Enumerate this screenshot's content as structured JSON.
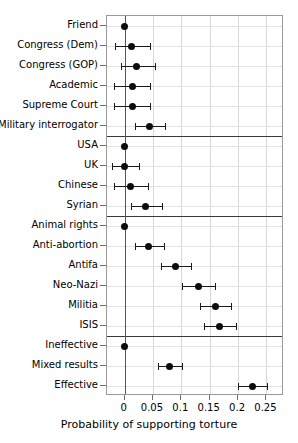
{
  "chart_data": {
    "type": "scatter",
    "title": "",
    "xlabel": "Probability of supporting torture",
    "ylabel": "",
    "xlim": [
      -0.031,
      0.281
    ],
    "ylim_categories_top_to_bottom": true,
    "grid": true,
    "legend": "none",
    "xticks": [
      0,
      0.05,
      0.1,
      0.15,
      0.2,
      0.25
    ],
    "xticklabels": [
      "0",
      "0.05",
      "0.1",
      "0.15",
      "0.2",
      "0.25"
    ],
    "reference_line_x": 0,
    "group_separators_after": [
      "Military interrogator",
      "Syrian",
      "ISIS"
    ],
    "categories": [
      "Friend",
      "Congress (Dem)",
      "Congress (GOP)",
      "Academic",
      "Supreme Court",
      "Military interrogator",
      "USA",
      "UK",
      "Chinese",
      "Syrian",
      "Animal rights",
      "Anti-abortion",
      "Antifa",
      "Neo-Nazi",
      "Militia",
      "ISIS",
      "Ineffective",
      "Mixed results",
      "Effective"
    ],
    "values": [
      0.0,
      0.013,
      0.021,
      0.014,
      0.014,
      0.044,
      0.0,
      0.0,
      0.011,
      0.037,
      0.0,
      0.042,
      0.09,
      0.13,
      0.16,
      0.168,
      0.0,
      0.08,
      0.226
    ],
    "ci_low": [
      null,
      -0.017,
      -0.007,
      -0.018,
      -0.018,
      0.018,
      null,
      -0.022,
      -0.018,
      0.012,
      null,
      0.018,
      0.065,
      0.102,
      0.133,
      0.14,
      null,
      0.059,
      0.2
    ],
    "ci_high": [
      null,
      0.045,
      0.054,
      0.045,
      0.045,
      0.072,
      null,
      0.026,
      0.041,
      0.066,
      null,
      0.07,
      0.117,
      0.16,
      0.188,
      0.197,
      null,
      0.101,
      0.251
    ],
    "points": [
      {
        "label": "Friend",
        "value": 0.0,
        "ci_low": null,
        "ci_high": null,
        "group": 1
      },
      {
        "label": "Congress (Dem)",
        "value": 0.013,
        "ci_low": -0.017,
        "ci_high": 0.045,
        "group": 1
      },
      {
        "label": "Congress (GOP)",
        "value": 0.021,
        "ci_low": -0.007,
        "ci_high": 0.054,
        "group": 1
      },
      {
        "label": "Academic",
        "value": 0.014,
        "ci_low": -0.018,
        "ci_high": 0.045,
        "group": 1
      },
      {
        "label": "Supreme Court",
        "value": 0.014,
        "ci_low": -0.018,
        "ci_high": 0.045,
        "group": 1
      },
      {
        "label": "Military interrogator",
        "value": 0.044,
        "ci_low": 0.018,
        "ci_high": 0.072,
        "group": 1
      },
      {
        "label": "USA",
        "value": 0.0,
        "ci_low": null,
        "ci_high": null,
        "group": 2
      },
      {
        "label": "UK",
        "value": 0.0,
        "ci_low": -0.022,
        "ci_high": 0.026,
        "group": 2
      },
      {
        "label": "Chinese",
        "value": 0.011,
        "ci_low": -0.018,
        "ci_high": 0.041,
        "group": 2
      },
      {
        "label": "Syrian",
        "value": 0.037,
        "ci_low": 0.012,
        "ci_high": 0.066,
        "group": 2
      },
      {
        "label": "Animal rights",
        "value": 0.0,
        "ci_low": null,
        "ci_high": null,
        "group": 3
      },
      {
        "label": "Anti-abortion",
        "value": 0.042,
        "ci_low": 0.018,
        "ci_high": 0.07,
        "group": 3
      },
      {
        "label": "Antifa",
        "value": 0.09,
        "ci_low": 0.065,
        "ci_high": 0.117,
        "group": 3
      },
      {
        "label": "Neo-Nazi",
        "value": 0.13,
        "ci_low": 0.102,
        "ci_high": 0.16,
        "group": 3
      },
      {
        "label": "Militia",
        "value": 0.16,
        "ci_low": 0.133,
        "ci_high": 0.188,
        "group": 3
      },
      {
        "label": "ISIS",
        "value": 0.168,
        "ci_low": 0.14,
        "ci_high": 0.197,
        "group": 3
      },
      {
        "label": "Ineffective",
        "value": 0.0,
        "ci_low": null,
        "ci_high": null,
        "group": 4
      },
      {
        "label": "Mixed results",
        "value": 0.08,
        "ci_low": 0.059,
        "ci_high": 0.101,
        "group": 4
      },
      {
        "label": "Effective",
        "value": 0.226,
        "ci_low": 0.2,
        "ci_high": 0.251,
        "group": 4
      }
    ],
    "colors": {
      "point": "#0d0d0d",
      "errorbar": "#1a1a1a",
      "grid": "#d8d8d8",
      "frame": "#9a9a9a",
      "zero_line": "#555555",
      "separator": "#3a3a3a",
      "background": "#ffffff",
      "text": "#000000"
    }
  }
}
